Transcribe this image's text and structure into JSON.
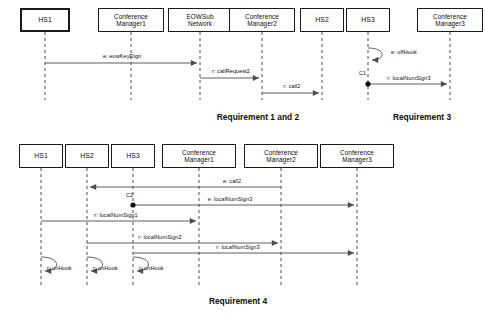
{
  "figure": {
    "type": "uml-sequence-diagrams",
    "background": "#ffffff",
    "line_color": "#4d4d4d",
    "box_border_color": "#1a1a1a",
    "text_color": "#0d0d0d"
  },
  "diagrams": [
    {
      "id": "requirement-1-and-2",
      "caption": "Requirement 1 and 2",
      "caption_x": 258,
      "caption_y": 112,
      "lifelines": [
        {
          "name": "HS1",
          "label": "HS1",
          "x": 45,
          "box_x": 20,
          "box_y": 8,
          "box_w": 50,
          "box_h": 24,
          "emphasis": true,
          "line_top": 32,
          "line_bottom": 100
        },
        {
          "name": "ConferenceManager1",
          "label": "Conference\nManager1",
          "x": 131,
          "box_x": 98,
          "box_y": 8,
          "box_w": 66,
          "box_h": 24,
          "emphasis": false,
          "line_top": 32,
          "line_bottom": 100
        },
        {
          "name": "EOWSubNetwork",
          "label": "EOWSub\nNetwork",
          "x": 200,
          "box_x": 168,
          "box_y": 8,
          "box_w": 64,
          "box_h": 24,
          "emphasis": false,
          "line_top": 32,
          "line_bottom": 100
        },
        {
          "name": "ConferenceManager2",
          "label": "Conference\nManager2",
          "x": 262,
          "box_x": 229,
          "box_y": 8,
          "box_w": 66,
          "box_h": 24,
          "emphasis": false,
          "line_top": 32,
          "line_bottom": 100
        },
        {
          "name": "HS2",
          "label": "HS2",
          "x": 322,
          "box_x": 300,
          "box_y": 8,
          "box_w": 44,
          "box_h": 24,
          "emphasis": false,
          "line_top": 32,
          "line_bottom": 100
        }
      ],
      "messages": [
        {
          "label": "e: eowKeyDigit",
          "from_x": 45,
          "to_x": 200,
          "y": 63,
          "label_x": 122,
          "label_y": 53,
          "direction": "right"
        },
        {
          "label": "r: callRequest2",
          "from_x": 200,
          "to_x": 262,
          "y": 78,
          "label_x": 231,
          "label_y": 68,
          "direction": "right"
        },
        {
          "label": "r: call2",
          "from_x": 262,
          "to_x": 322,
          "y": 93,
          "label_x": 292,
          "label_y": 83,
          "direction": "right"
        }
      ],
      "self_messages": [],
      "conditions": []
    },
    {
      "id": "requirement-3",
      "caption": "Requirement 3",
      "caption_x": 422,
      "caption_y": 112,
      "lifelines": [
        {
          "name": "HS3",
          "label": "HS3",
          "x": 368,
          "box_x": 346,
          "box_y": 8,
          "box_w": 44,
          "box_h": 24,
          "emphasis": false,
          "line_top": 32,
          "line_bottom": 100
        },
        {
          "name": "ConferenceManager3",
          "label": "Conference\nManager3",
          "x": 450,
          "box_x": 417,
          "box_y": 8,
          "box_w": 66,
          "box_h": 24,
          "emphasis": false,
          "line_top": 32,
          "line_bottom": 100
        }
      ],
      "messages": [
        {
          "label": "r: localNumSign3",
          "from_x": 368,
          "to_x": 450,
          "y": 84,
          "label_x": 409,
          "label_y": 75,
          "direction": "right"
        }
      ],
      "self_messages": [
        {
          "label": "e: offHook",
          "x": 368,
          "y_top": 48,
          "y_bottom": 60,
          "loop_w": 18,
          "label_x": 391,
          "label_y": 49
        }
      ],
      "conditions": [
        {
          "label": "C1",
          "x": 368,
          "y": 84,
          "label_x": 359,
          "label_y": 70
        }
      ]
    },
    {
      "id": "requirement-4",
      "caption": "Requirement 4",
      "caption_x": 238,
      "caption_y": 296,
      "lifelines": [
        {
          "name": "HS1",
          "label": "HS1",
          "x": 41,
          "box_x": 19,
          "box_y": 144,
          "box_w": 44,
          "box_h": 24,
          "emphasis": false,
          "line_top": 168,
          "line_bottom": 285
        },
        {
          "name": "HS2",
          "label": "HS2",
          "x": 87,
          "box_x": 65,
          "box_y": 144,
          "box_w": 44,
          "box_h": 24,
          "emphasis": false,
          "line_top": 168,
          "line_bottom": 285
        },
        {
          "name": "HS3",
          "label": "HS3",
          "x": 133,
          "box_x": 111,
          "box_y": 144,
          "box_w": 44,
          "box_h": 24,
          "emphasis": false,
          "line_top": 168,
          "line_bottom": 285
        },
        {
          "name": "ConferenceManager1",
          "label": "Conference\nManager1",
          "x": 199,
          "box_x": 162,
          "box_y": 144,
          "box_w": 74,
          "box_h": 24,
          "emphasis": false,
          "line_top": 168,
          "line_bottom": 285
        },
        {
          "name": "ConferenceManager2",
          "label": "Conference\nManager2",
          "x": 281,
          "box_x": 244,
          "box_y": 144,
          "box_w": 74,
          "box_h": 24,
          "emphasis": false,
          "line_top": 168,
          "line_bottom": 285
        },
        {
          "name": "ConferenceManager3",
          "label": "Conference\nManager3",
          "x": 357,
          "box_x": 320,
          "box_y": 144,
          "box_w": 74,
          "box_h": 24,
          "emphasis": false,
          "line_top": 168,
          "line_bottom": 285
        }
      ],
      "messages": [
        {
          "label": "e: call2",
          "from_x": 281,
          "to_x": 87,
          "y": 187,
          "label_x": 232,
          "label_y": 178,
          "direction": "left"
        },
        {
          "label": "e: localNumSign3",
          "from_x": 133,
          "to_x": 357,
          "y": 205,
          "label_x": 230,
          "label_y": 196,
          "direction": "right"
        },
        {
          "label": "r: localNumSign1",
          "from_x": 41,
          "to_x": 199,
          "y": 221,
          "label_x": 116,
          "label_y": 212,
          "direction": "right"
        },
        {
          "label": "r: localNumSign2",
          "from_x": 87,
          "to_x": 281,
          "y": 243,
          "label_x": 160,
          "label_y": 234,
          "direction": "right"
        },
        {
          "label": "r: localNumSign3",
          "from_x": 133,
          "to_x": 357,
          "y": 253,
          "label_x": 238,
          "label_y": 244,
          "direction": "right"
        }
      ],
      "self_messages": [
        {
          "label": "r: onHook",
          "x": 41,
          "y_top": 257,
          "y_bottom": 271,
          "loop_w": 20,
          "label_x": 47,
          "label_y": 265
        },
        {
          "label": "r: onHook",
          "x": 87,
          "y_top": 257,
          "y_bottom": 271,
          "loop_w": 20,
          "label_x": 93,
          "label_y": 265
        },
        {
          "label": "r: onHook",
          "x": 133,
          "y_top": 257,
          "y_bottom": 271,
          "loop_w": 20,
          "label_x": 139,
          "label_y": 265
        }
      ],
      "conditions": [
        {
          "label": "C2",
          "x": 133,
          "y": 205,
          "label_x": 126,
          "label_y": 192
        }
      ]
    }
  ]
}
